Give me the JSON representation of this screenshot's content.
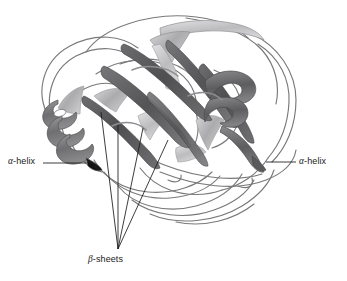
{
  "figure": {
    "type": "protein-ribbon-diagram",
    "background_color": "#ffffff",
    "palette": {
      "beta_strand_dark": "#59595b",
      "beta_strand_mid": "#6e6e70",
      "helix_dark": "#6b6b6d",
      "helix_mid": "#8d8d8f",
      "ribbon_light": "#b9b9bb",
      "ribbon_pale": "#d5d5d7",
      "outline": "#6f6f71",
      "leader_line": "#1a1a1a",
      "text": "#1a1a1a"
    }
  },
  "labels": {
    "alpha_left": {
      "greek": "α",
      "rest": "-helix",
      "full": "α-helix"
    },
    "alpha_right": {
      "greek": "α",
      "rest": "-helix",
      "full": "α-helix"
    },
    "beta": {
      "greek": "β",
      "rest": "-sheets",
      "full": "β-sheets"
    }
  },
  "annotations": {
    "leader_lines": [
      {
        "name": "alpha-left-leader",
        "x1": 43,
        "y1": 163,
        "x2": 86,
        "y2": 163
      },
      {
        "name": "alpha-right-leader",
        "x1": 296,
        "y1": 162,
        "x2": 266,
        "y2": 162
      },
      {
        "name": "beta-leader-1",
        "x1": 118,
        "y1": 249,
        "x2": 101,
        "y2": 112
      },
      {
        "name": "beta-leader-2",
        "x1": 118,
        "y1": 249,
        "x2": 118,
        "y2": 125
      },
      {
        "name": "beta-leader-3",
        "x1": 118,
        "y1": 249,
        "x2": 143,
        "y2": 128
      },
      {
        "name": "beta-leader-4",
        "x1": 118,
        "y1": 249,
        "x2": 168,
        "y2": 140
      }
    ]
  }
}
